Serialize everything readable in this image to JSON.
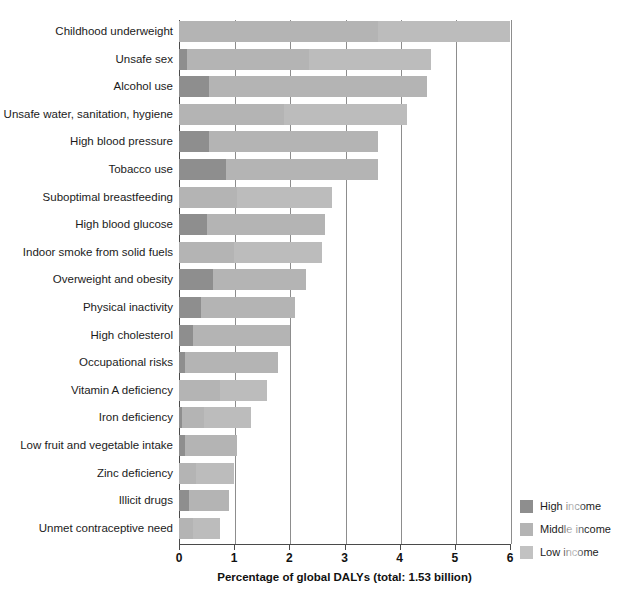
{
  "chart_data": {
    "type": "bar",
    "orientation": "horizontal",
    "stacked": true,
    "title": "",
    "xlabel": "Percentage of global DALYs (total: 1.53 billion)",
    "ylabel": "",
    "xlim": [
      0,
      6
    ],
    "xticks": [
      "0",
      "1",
      "2",
      "3",
      "4",
      "5",
      "6"
    ],
    "grid": true,
    "legend_position": "bottom-right",
    "categories": [
      "Childhood underweight",
      "Unsafe sex",
      "Alcohol use",
      "Unsafe water, sanitation, hygiene",
      "High blood pressure",
      "Tobacco use",
      "Suboptimal breastfeeding",
      "High blood glucose",
      "Indoor smoke from solid fuels",
      "Overweight and obesity",
      "Physical inactivity",
      "High cholesterol",
      "Occupational risks",
      "Vitamin A deficiency",
      "Iron deficiency",
      "Low fruit and vegetable intake",
      "Zinc deficiency",
      "Illicit drugs",
      "Unmet contraceptive need"
    ],
    "series": [
      {
        "name": "High income",
        "color": "#8e8e8e",
        "values": [
          0.0,
          0.15,
          0.55,
          0.0,
          0.55,
          0.85,
          0.0,
          0.5,
          0.0,
          0.62,
          0.4,
          0.26,
          0.1,
          0.0,
          0.05,
          0.1,
          0.0,
          0.18,
          0.0
        ]
      },
      {
        "name": "Middle income",
        "color": "#b4b4b4",
        "values": [
          3.6,
          2.2,
          3.95,
          1.9,
          3.05,
          2.75,
          1.05,
          2.15,
          1.0,
          1.68,
          1.7,
          1.76,
          1.7,
          0.75,
          0.4,
          0.95,
          0.3,
          0.72,
          0.25
        ]
      },
      {
        "name": "Low income",
        "color": "#bcbcbc",
        "values": [
          2.4,
          2.22,
          0.0,
          2.23,
          0.0,
          0.0,
          1.73,
          0.0,
          1.6,
          0.0,
          0.0,
          0.0,
          0.0,
          0.85,
          0.85,
          0.0,
          0.7,
          0.0,
          0.5
        ]
      }
    ],
    "totals": [
      6.0,
      4.57,
      4.5,
      4.13,
      3.6,
      3.6,
      2.78,
      2.65,
      2.6,
      2.3,
      2.1,
      2.02,
      1.8,
      1.6,
      1.3,
      1.05,
      1.0,
      0.9,
      0.75
    ]
  },
  "legend": {
    "items": [
      {
        "label": "High income",
        "color": "#8e8e8e"
      },
      {
        "label": "Middle income",
        "color": "#b4b4b4"
      },
      {
        "label": "Low income",
        "color": "#c2c2c2"
      }
    ]
  }
}
